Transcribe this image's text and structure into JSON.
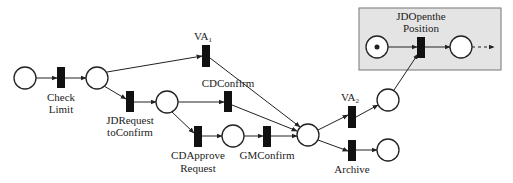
{
  "diagram": {
    "type": "petri-net",
    "highlight_box": {
      "x": 359,
      "y": 8,
      "w": 142,
      "h": 62,
      "fill": "#e4e4e4",
      "stroke": "#777777"
    },
    "places": [
      {
        "id": "p_start",
        "cx": 25,
        "cy": 78,
        "r": 11,
        "token": false
      },
      {
        "id": "p_checked",
        "cx": 97,
        "cy": 78,
        "r": 11,
        "token": false
      },
      {
        "id": "p_requested",
        "cx": 167,
        "cy": 102,
        "r": 11,
        "token": false
      },
      {
        "id": "p_approved",
        "cx": 233,
        "cy": 136,
        "r": 11,
        "token": false
      },
      {
        "id": "p_merge",
        "cx": 308,
        "cy": 135,
        "r": 11,
        "token": false
      },
      {
        "id": "p_va2",
        "cx": 388,
        "cy": 100,
        "r": 11,
        "token": false
      },
      {
        "id": "p_archive",
        "cx": 388,
        "cy": 150,
        "r": 11,
        "token": false
      },
      {
        "id": "p_position_start",
        "cx": 377,
        "cy": 47,
        "r": 11,
        "token": true
      },
      {
        "id": "p_position_end",
        "cx": 461,
        "cy": 47,
        "r": 11,
        "token": false
      }
    ],
    "transitions": [
      {
        "id": "t_check_limit",
        "x": 57,
        "y": 67,
        "w": 8,
        "h": 21,
        "label": [
          "Check",
          "Limit"
        ],
        "label_x": 61,
        "label_y": [
          101,
          113
        ]
      },
      {
        "id": "t_va1",
        "x": 202,
        "y": 45,
        "w": 8,
        "h": 22,
        "label": [
          "VA"
        ],
        "sub": "1",
        "label_x": 203,
        "label_y": [
          40
        ]
      },
      {
        "id": "t_jdrequest",
        "x": 126,
        "y": 91,
        "w": 8,
        "h": 21,
        "label": [
          "JDRequest",
          "toConfirm"
        ],
        "label_x": 130,
        "label_y": [
          124,
          136
        ]
      },
      {
        "id": "t_cdconfirm",
        "x": 224,
        "y": 91,
        "w": 8,
        "h": 21,
        "label": [
          "CDConfirm"
        ],
        "label_x": 228,
        "label_y": [
          87
        ]
      },
      {
        "id": "t_cdapprove",
        "x": 194,
        "y": 126,
        "w": 8,
        "h": 21,
        "label": [
          "CDApprove",
          "Request"
        ],
        "label_x": 198,
        "label_y": [
          159,
          172
        ]
      },
      {
        "id": "t_gmconfirm",
        "x": 263,
        "y": 126,
        "w": 8,
        "h": 21,
        "label": [
          "GMConfirm"
        ],
        "label_x": 267,
        "label_y": [
          159
        ]
      },
      {
        "id": "t_va2",
        "x": 348,
        "y": 106,
        "w": 8,
        "h": 22,
        "label": [
          "VA"
        ],
        "sub": "2",
        "label_x": 350,
        "label_y": [
          101
        ]
      },
      {
        "id": "t_archive",
        "x": 348,
        "y": 140,
        "w": 8,
        "h": 21,
        "label": [
          "Archive"
        ],
        "label_x": 352,
        "label_y": [
          173
        ]
      },
      {
        "id": "t_jdopen",
        "x": 417,
        "y": 37,
        "w": 8,
        "h": 21,
        "label": [
          "JDOpenthe",
          "Position"
        ],
        "label_x": 421,
        "label_y": [
          20,
          32
        ]
      }
    ],
    "arcs": [
      {
        "from": [
          36,
          78
        ],
        "to": [
          57,
          78
        ]
      },
      {
        "from": [
          65,
          78
        ],
        "to": [
          86,
          78
        ]
      },
      {
        "from": [
          107,
          72
        ],
        "to": [
          202,
          56
        ]
      },
      {
        "from": [
          104,
          86
        ],
        "to": [
          126,
          99
        ]
      },
      {
        "from": [
          134,
          102
        ],
        "to": [
          156,
          102
        ]
      },
      {
        "from": [
          178,
          102
        ],
        "to": [
          224,
          102
        ]
      },
      {
        "from": [
          172,
          112
        ],
        "to": [
          194,
          133
        ]
      },
      {
        "from": [
          202,
          136
        ],
        "to": [
          222,
          136
        ]
      },
      {
        "from": [
          244,
          136
        ],
        "to": [
          263,
          136
        ]
      },
      {
        "from": [
          210,
          58
        ],
        "to": [
          300,
          127
        ]
      },
      {
        "from": [
          232,
          105
        ],
        "to": [
          297,
          131
        ]
      },
      {
        "from": [
          271,
          136
        ],
        "to": [
          297,
          136
        ]
      },
      {
        "from": [
          318,
          130
        ],
        "to": [
          348,
          115
        ]
      },
      {
        "from": [
          318,
          140
        ],
        "to": [
          348,
          151
        ]
      },
      {
        "from": [
          356,
          117
        ],
        "to": [
          378,
          105
        ]
      },
      {
        "from": [
          356,
          150
        ],
        "to": [
          377,
          150
        ]
      },
      {
        "from": [
          394,
          90
        ],
        "to": [
          418,
          54
        ]
      },
      {
        "from": [
          388,
          47
        ],
        "to": [
          417,
          47
        ]
      },
      {
        "from": [
          425,
          47
        ],
        "to": [
          450,
          47
        ]
      }
    ],
    "dashed_arcs": [
      {
        "from": [
          472,
          47
        ],
        "to": [
          494,
          47
        ]
      }
    ],
    "colors": {
      "stroke": "#222222",
      "transition_fill": "#111111",
      "place_fill": "#ffffff",
      "label": "#222222"
    }
  }
}
